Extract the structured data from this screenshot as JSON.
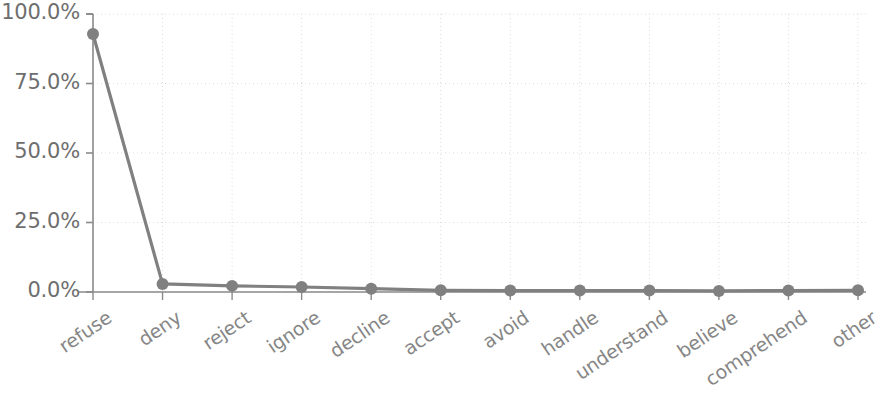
{
  "chart_data": {
    "type": "line",
    "title": "",
    "subtitle": "",
    "xlabel": "",
    "ylabel": "",
    "categories": [
      "refuse",
      "deny",
      "reject",
      "ignore",
      "decline",
      "accept",
      "avoid",
      "handle",
      "understand",
      "believe",
      "comprehend",
      "other"
    ],
    "series": [
      {
        "name": "frequency",
        "values": [
          92.8,
          2.9,
          2.2,
          1.8,
          1.2,
          0.6,
          0.5,
          0.5,
          0.5,
          0.4,
          0.5,
          0.6
        ]
      }
    ],
    "ylim": [
      0,
      100
    ],
    "ytick_values": [
      0,
      25,
      50,
      75,
      100
    ],
    "ytick_labels": [
      "0.0%",
      "25.0%",
      "50.0%",
      "75.0%",
      "100.0%"
    ],
    "grid": true,
    "legend": "none",
    "line_color": "#808080",
    "marker_color": "#808080",
    "marker_shape": "circle",
    "grid_color": "#dcdcdc",
    "axis_color": "#8a8a8a",
    "tick_label_color": "#6e6e6e",
    "xtick_label_color": "#868686",
    "xtick_rotation_deg": -34
  }
}
